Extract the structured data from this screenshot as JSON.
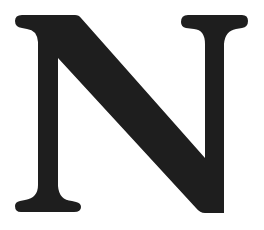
{
  "glyph": {
    "character": "N",
    "style": "serif",
    "fill_color": "#1e1e1e",
    "background_color": "#ffffff"
  }
}
